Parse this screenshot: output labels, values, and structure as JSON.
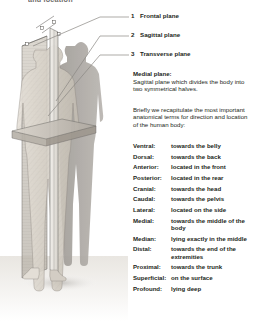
{
  "header": {
    "text": "and location"
  },
  "legend": {
    "items": [
      {
        "num": "1",
        "label": "Frontal plane"
      },
      {
        "num": "2",
        "label": "Sagittal plane"
      },
      {
        "num": "3",
        "label": "Transverse plane"
      }
    ]
  },
  "medial_plane": {
    "heading": "Medial plane:",
    "body": "Sagittal plane which divides the body into two symmetrical halves."
  },
  "intro": {
    "body": "Briefly we recapitulate the most important anatomical terms for direction and location of the human body:"
  },
  "glossary": {
    "rows": [
      {
        "term": "Ventral:",
        "definition": "towards the belly"
      },
      {
        "term": "Dorsal:",
        "definition": "towards the back"
      },
      {
        "term": "Anterior:",
        "definition": "located in the front"
      },
      {
        "term": "Posterior:",
        "definition": "located in the rear"
      },
      {
        "term": "Cranial:",
        "definition": "towards the head"
      },
      {
        "term": "Caudal:",
        "definition": "towards the pelvis"
      },
      {
        "term": "Lateral:",
        "definition": "located on the side"
      },
      {
        "term": "Medial:",
        "definition": "towards the middle of the body"
      },
      {
        "term": "Median:",
        "definition": "lying exactly in the middle"
      },
      {
        "term": "Distal:",
        "definition": "towards the end of the extremities"
      },
      {
        "term": "Proximal:",
        "definition": "towards the trunk"
      },
      {
        "term": "Superficial:",
        "definition": "on the surface"
      },
      {
        "term": "Profound:",
        "definition": "lying deep"
      }
    ]
  },
  "illustration": {
    "name": "human-body-anatomical-planes",
    "colors": {
      "body_light": "#ddd8d0",
      "body_mid": "#bdb7ad",
      "shadow_figure": "#8e8a85",
      "plane_line": "#6d6a66",
      "leader_line": "#8a8782",
      "background": "#ffffff"
    }
  }
}
